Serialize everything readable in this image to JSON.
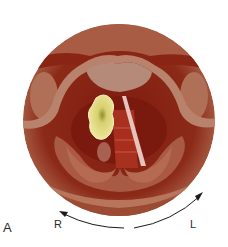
{
  "figure": {
    "panel_label": "A",
    "orientation": {
      "right_label": "R",
      "left_label": "L"
    },
    "colors": {
      "background": "#ffffff",
      "outer_mucosa": "#a0523f",
      "deep_red": "#8a1f14",
      "epiglottis": "#b7836e",
      "fold_tissue": "#b06248",
      "lesion": "#ede48e",
      "lesion_center": "#9a9a38",
      "vocal_cord_white": "#e8c8c0",
      "trachea_rings": "#b23a2a",
      "arrow": "#1a1a1a"
    }
  }
}
